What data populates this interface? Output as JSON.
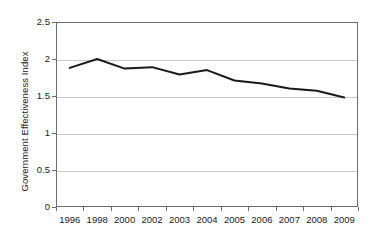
{
  "chart_data": {
    "type": "line",
    "title": "",
    "xlabel": "",
    "ylabel": "Government Effectiveness Index",
    "categories": [
      "1996",
      "1998",
      "2000",
      "2002",
      "2003",
      "2004",
      "2005",
      "2006",
      "2007",
      "2008",
      "2009"
    ],
    "series": [
      {
        "name": "Government Effectiveness Index",
        "values": [
          1.88,
          2.0,
          1.87,
          1.89,
          1.79,
          1.85,
          1.71,
          1.67,
          1.6,
          1.57,
          1.48
        ]
      }
    ],
    "ylim": [
      0,
      2.5
    ],
    "yticks": [
      "0",
      "0.5",
      "1",
      "1.5",
      "2",
      "2.5"
    ],
    "ytick_values": [
      0,
      0.5,
      1,
      1.5,
      2,
      2.5
    ],
    "grid": "horizontal",
    "legend": "none",
    "line_color": "#1a1a1a",
    "grid_color": "#c8c8c8",
    "axis_color": "#6d6d6d",
    "background": "#ffffff"
  }
}
